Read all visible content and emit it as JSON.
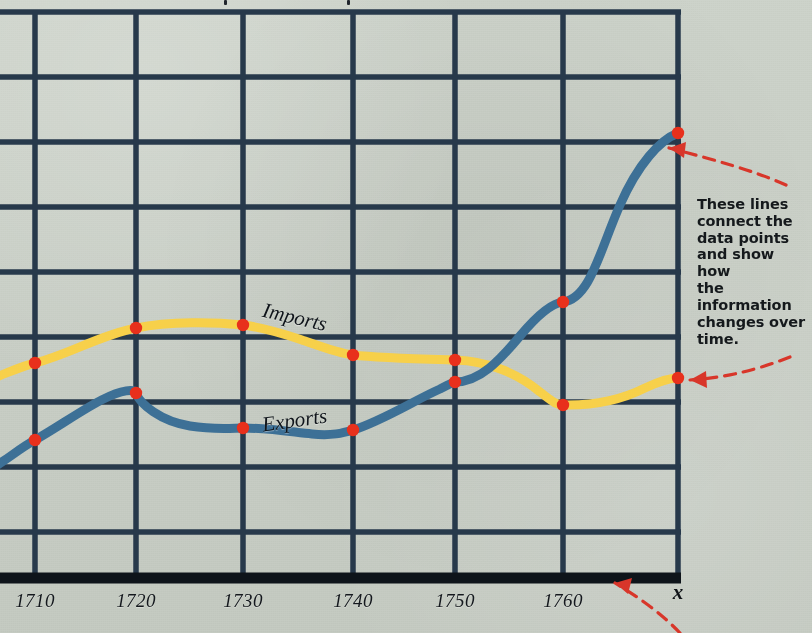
{
  "figure": {
    "background_color": "#c9cfc7",
    "grid_color": "#27394b",
    "axis_color": "#10161d",
    "marker_color": "#e8301c",
    "callout_arrow_color": "#d8362a"
  },
  "callout": {
    "name": "data-line-callout",
    "lines": [
      "These lines",
      "connect the",
      "data points",
      "and show how",
      "the information",
      "changes over",
      "time."
    ],
    "text": "These lines connect the data points and show how the information changes over time."
  },
  "chart_data": {
    "type": "line",
    "title": "",
    "xlabel": "x",
    "ylabel": "",
    "grid": true,
    "legend_position": "inline-labels",
    "x_axis_variable": "x",
    "xlim": [
      1705,
      1765
    ],
    "tick_labels": [
      "1710",
      "1720",
      "1730",
      "1740",
      "1750",
      "1760"
    ],
    "x": [
      1710,
      1720,
      1730,
      1740,
      1750,
      1760,
      1765
    ],
    "series": [
      {
        "name": "Imports",
        "color": "#f7d04a",
        "values": [
          3.3,
          3.85,
          3.9,
          3.45,
          3.4,
          2.65,
          3.05
        ]
      },
      {
        "name": "Exports",
        "color": "#3d7096",
        "values": [
          2.1,
          2.8,
          2.25,
          2.2,
          3.3,
          4.25,
          6.85
        ]
      }
    ]
  },
  "geometry": {
    "plot_left": 35,
    "plot_right": 678,
    "plot_top": 12,
    "plot_bottom": 578,
    "vertical_gridlines": [
      35,
      136,
      243,
      353,
      455,
      563,
      678
    ],
    "horizontal_gridlines": [
      12,
      77,
      142,
      207,
      272,
      337,
      402,
      467,
      532
    ],
    "tick_label_y": 590,
    "imports_points": [
      [
        35,
        363
      ],
      [
        136,
        328
      ],
      [
        243,
        325
      ],
      [
        353,
        355
      ],
      [
        455,
        360
      ],
      [
        563,
        405
      ],
      [
        678,
        378
      ]
    ],
    "exports_points": [
      [
        35,
        440
      ],
      [
        136,
        393
      ],
      [
        243,
        428
      ],
      [
        353,
        430
      ],
      [
        455,
        382
      ],
      [
        563,
        302
      ],
      [
        678,
        133
      ]
    ],
    "imports_path": "M -14,381 C 10,372 22,366 35,363 C 70,354 100,335 136,328 C 170,321 215,322 243,325 C 268,328 290,336 305,341 C 325,348 338,353 353,355 C 378,358 420,359 455,360 C 490,361 520,375 540,392 C 552,401 556,405 563,405 C 600,406 625,398 645,388 C 662,380 672,378 678,378",
    "exports_path": "M -14,472 C 4,462 20,448 35,440 C 62,425 98,398 121,392 C 132,389 136,391 136,393 C 140,404 160,421 190,426 C 215,430 233,428 243,428 C 268,428 292,432 312,434 C 332,436 343,433 353,430 C 382,421 415,400 440,389 C 450,384 453,382 455,382 C 480,382 500,360 520,336 C 540,312 553,303 563,302 C 590,299 600,250 620,205 C 638,164 660,140 678,133"
  },
  "series_labels": {
    "imports": "Imports",
    "exports": "Exports"
  }
}
